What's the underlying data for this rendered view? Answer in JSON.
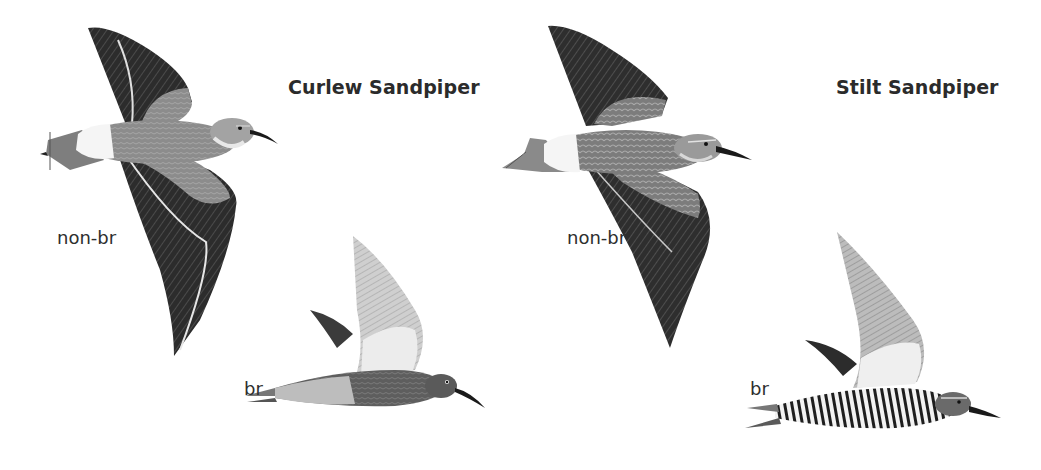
{
  "plate": {
    "species": [
      {
        "name": "Curlew Sandpiper",
        "figures": [
          {
            "label": "non-br",
            "pose": "flight-above"
          },
          {
            "label": "br",
            "pose": "flight-side"
          }
        ]
      },
      {
        "name": "Stilt Sandpiper",
        "figures": [
          {
            "label": "non-br",
            "pose": "flight-above"
          },
          {
            "label": "br",
            "pose": "flight-side"
          }
        ]
      }
    ],
    "colors": {
      "background": "#ffffff",
      "text": "#2b2b2b",
      "wing_dark": "#2f2f2f",
      "body_mid": "#8a8a8a",
      "wing_light": "#d6d6d6",
      "rump_white": "#f4f4f4"
    }
  }
}
